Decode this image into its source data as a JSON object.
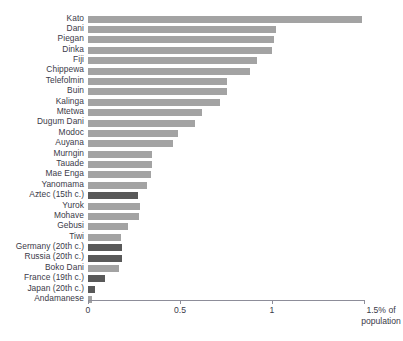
{
  "chart_data": {
    "type": "bar",
    "orientation": "horizontal",
    "title": "",
    "xlabel": "1.5% of population",
    "ylabel": "",
    "xlim": [
      0,
      1.5
    ],
    "grid": false,
    "legend": null,
    "axis_ticks": [
      {
        "value": 0,
        "label": "0"
      },
      {
        "value": 0.5,
        "label": "0.5"
      },
      {
        "value": 1,
        "label": "1"
      },
      {
        "value": 1.5,
        "label": "1.5% of\npopulation"
      }
    ],
    "tick_labels": [
      "0",
      "0.5",
      "1",
      "1.5% of"
    ],
    "axis_end_label_line1": "1.5% of",
    "axis_end_label_line2": "population",
    "colors": {
      "light": "#a3a3a3",
      "dark": "#595959",
      "axis": "#8d8d99",
      "text": "#3a3a48"
    },
    "categories": [
      "Kato",
      "Dani",
      "Piegan",
      "Dinka",
      "Fiji",
      "Chippewa",
      "Telefolmin",
      "Buin",
      "Kalinga",
      "Mtetwa",
      "Dugum Dani",
      "Modoc",
      "Auyana",
      "Murngin",
      "Tauade",
      "Mae Enga",
      "Yanomama",
      "Aztec (15th c.)",
      "Yurok",
      "Mohave",
      "Gebusi",
      "Tiwi",
      "Germany (20th c.)",
      "Russia (20th c.)",
      "Boko Dani",
      "France (19th c.)",
      "Japan (20th c.)",
      "Andamanese"
    ],
    "values": [
      1.49,
      1.02,
      1.01,
      1.0,
      0.92,
      0.88,
      0.755,
      0.755,
      0.72,
      0.62,
      0.58,
      0.49,
      0.46,
      0.35,
      0.35,
      0.34,
      0.32,
      0.27,
      0.28,
      0.275,
      0.22,
      0.18,
      0.185,
      0.185,
      0.17,
      0.09,
      0.04,
      0.02
    ],
    "shades": [
      "light",
      "light",
      "light",
      "light",
      "light",
      "light",
      "light",
      "light",
      "light",
      "light",
      "light",
      "light",
      "light",
      "light",
      "light",
      "light",
      "light",
      "dark",
      "light",
      "light",
      "light",
      "light",
      "dark",
      "dark",
      "light",
      "dark",
      "dark",
      "light"
    ]
  }
}
